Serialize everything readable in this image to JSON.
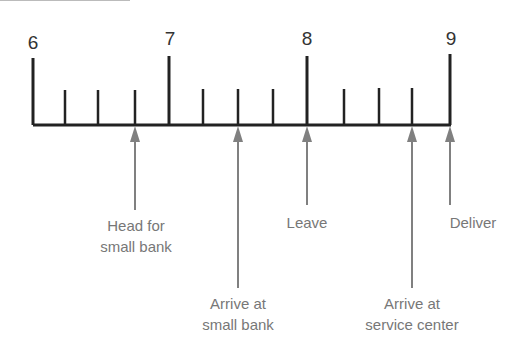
{
  "timeline": {
    "hours": [
      {
        "label": "6",
        "x": 33
      },
      {
        "label": "7",
        "x": 169
      },
      {
        "label": "8",
        "x": 307
      },
      {
        "label": "9",
        "x": 450
      }
    ],
    "minor_ticks_x": [
      65,
      98,
      135,
      203,
      238,
      273,
      344,
      379,
      412
    ],
    "events": [
      {
        "id": "head",
        "line1": "Head for",
        "line2": "small bank",
        "x": 135
      },
      {
        "id": "arrive-bank",
        "line1": "Arrive at",
        "line2": "small bank",
        "x": 238
      },
      {
        "id": "leave",
        "line1": "Leave",
        "line2": "",
        "x": 307
      },
      {
        "id": "arrive-center",
        "line1": "Arrive at",
        "line2": "service center",
        "x": 412
      },
      {
        "id": "deliver",
        "line1": "Deliver",
        "line2": "",
        "x": 450
      }
    ],
    "colors": {
      "axis": "#222222",
      "arrow": "#808080",
      "label": "#777777"
    }
  }
}
